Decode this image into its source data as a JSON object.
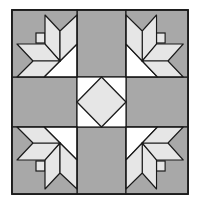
{
  "colors": {
    "background": "#ffffff",
    "gray": "#a8a8a8",
    "light": "#e6e6e6",
    "white": "#ffffff",
    "line": "#1a1a1a"
  },
  "block": {
    "x": 12,
    "y": 10,
    "width": 176,
    "height": 184,
    "grid_x": [
      12,
      77,
      126,
      188
    ],
    "grid_y": [
      10,
      77,
      127,
      194
    ]
  },
  "units": {
    "corners": [
      "top-left-flower",
      "top-right-flower",
      "bottom-left-flower",
      "bottom-right-flower"
    ],
    "edges": [
      "top-gray-square",
      "left-gray-square",
      "right-gray-square",
      "bottom-gray-square"
    ],
    "center": "square-in-a-square"
  }
}
